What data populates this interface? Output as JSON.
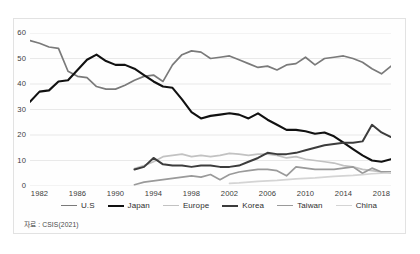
{
  "source_note": "자료 : CSIS(2021)",
  "chart_data": {
    "type": "line",
    "title": "",
    "xlabel": "",
    "ylabel": "",
    "grid": true,
    "legend_position": "bottom",
    "xlim": [
      1981,
      2019
    ],
    "ylim": [
      0,
      60
    ],
    "yticks": [
      0,
      10,
      20,
      30,
      40,
      50,
      60
    ],
    "xticks": [
      1982,
      1986,
      1990,
      1994,
      1998,
      2002,
      2006,
      2010,
      2014,
      2018
    ],
    "colors": {
      "U.S": "#7a7a7a",
      "Japan": "#111111",
      "Europe": "#c2c2c2",
      "Korea": "#3c3c3c",
      "Taiwan": "#9a9a9a",
      "China": "#d4d4d4"
    },
    "series": [
      {
        "name": "U.S",
        "color": "#7a7a7a",
        "width": 1.7,
        "x": [
          1981,
          1982,
          1983,
          1984,
          1985,
          1986,
          1987,
          1988,
          1989,
          1990,
          1991,
          1992,
          1993,
          1994,
          1995,
          1996,
          1997,
          1998,
          1999,
          2000,
          2001,
          2002,
          2003,
          2004,
          2005,
          2006,
          2007,
          2008,
          2009,
          2010,
          2011,
          2012,
          2013,
          2014,
          2015,
          2016,
          2017,
          2018,
          2019
        ],
        "values": [
          57.0,
          56.0,
          54.5,
          54.0,
          45.0,
          43.0,
          42.5,
          39.0,
          38.0,
          38.0,
          39.5,
          41.5,
          43.0,
          43.5,
          41.0,
          47.5,
          51.5,
          53.0,
          52.5,
          50.0,
          50.5,
          51.0,
          49.5,
          48.0,
          46.5,
          47.0,
          45.5,
          47.5,
          48.0,
          50.5,
          47.5,
          50.0,
          50.5,
          51.0,
          50.0,
          48.5,
          46.0,
          44.0,
          47.0
        ]
      },
      {
        "name": "Japan",
        "color": "#111111",
        "width": 2.1,
        "x": [
          1981,
          1982,
          1983,
          1984,
          1985,
          1986,
          1987,
          1988,
          1989,
          1990,
          1991,
          1992,
          1993,
          1994,
          1995,
          1996,
          1997,
          1998,
          1999,
          2000,
          2001,
          2002,
          2003,
          2004,
          2005,
          2006,
          2007,
          2008,
          2009,
          2010,
          2011,
          2012,
          2013,
          2014,
          2015,
          2016,
          2017,
          2018,
          2019
        ],
        "values": [
          33.0,
          37.0,
          37.5,
          41.0,
          41.5,
          45.5,
          49.5,
          51.5,
          49.0,
          47.5,
          47.5,
          46.0,
          43.5,
          41.0,
          39.0,
          38.5,
          34.0,
          29.0,
          26.5,
          27.5,
          28.0,
          28.5,
          28.0,
          26.5,
          28.5,
          26.0,
          24.0,
          22.0,
          22.0,
          21.5,
          20.5,
          21.0,
          19.5,
          17.0,
          14.5,
          12.0,
          10.0,
          9.5,
          10.5
        ]
      },
      {
        "name": "Europe",
        "color": "#c2c2c2",
        "width": 1.7,
        "x": [
          1992,
          1993,
          1994,
          1995,
          1996,
          1997,
          1998,
          1999,
          2000,
          2001,
          2002,
          2003,
          2004,
          2005,
          2006,
          2007,
          2008,
          2009,
          2010,
          2011,
          2012,
          2013,
          2014,
          2015,
          2016,
          2017,
          2018,
          2019
        ],
        "values": [
          6.8,
          8.0,
          9.5,
          11.5,
          12.0,
          12.5,
          11.5,
          12.0,
          11.5,
          12.0,
          12.8,
          12.5,
          12.0,
          12.5,
          12.5,
          12.0,
          11.0,
          11.5,
          10.5,
          10.0,
          9.5,
          9.0,
          8.0,
          7.5,
          6.5,
          6.0,
          5.5,
          5.0
        ]
      },
      {
        "name": "Korea",
        "color": "#3c3c3c",
        "width": 2.0,
        "x": [
          1992,
          1993,
          1994,
          1995,
          1996,
          1997,
          1998,
          1999,
          2000,
          2001,
          2002,
          2003,
          2004,
          2005,
          2006,
          2007,
          2008,
          2009,
          2010,
          2011,
          2012,
          2013,
          2014,
          2015,
          2016,
          2017,
          2018,
          2019
        ],
        "values": [
          6.5,
          7.5,
          11.0,
          8.5,
          8.0,
          8.0,
          7.5,
          8.0,
          8.0,
          7.5,
          7.5,
          8.0,
          9.5,
          11.0,
          13.0,
          12.5,
          12.5,
          13.0,
          14.0,
          15.0,
          16.0,
          16.5,
          17.0,
          17.0,
          17.5,
          24.0,
          21.0,
          19.2
        ]
      },
      {
        "name": "Taiwan",
        "color": "#9a9a9a",
        "width": 1.7,
        "x": [
          1992,
          1993,
          1994,
          1995,
          1996,
          1997,
          1998,
          1999,
          2000,
          2001,
          2002,
          2003,
          2004,
          2005,
          2006,
          2007,
          2008,
          2009,
          2010,
          2011,
          2012,
          2013,
          2014,
          2015,
          2016,
          2017,
          2018,
          2019
        ],
        "values": [
          0.5,
          1.5,
          2.0,
          2.5,
          3.0,
          3.5,
          4.0,
          3.5,
          4.5,
          2.5,
          4.5,
          5.5,
          6.0,
          6.5,
          6.5,
          6.0,
          4.0,
          7.5,
          7.0,
          6.5,
          6.5,
          6.5,
          7.0,
          7.5,
          5.0,
          7.0,
          5.5,
          5.5
        ]
      },
      {
        "name": "China",
        "color": "#d4d4d4",
        "width": 1.7,
        "x": [
          2002,
          2003,
          2004,
          2005,
          2006,
          2007,
          2008,
          2009,
          2010,
          2011,
          2012,
          2013,
          2014,
          2015,
          2016,
          2017,
          2018,
          2019
        ],
        "values": [
          1.0,
          1.2,
          1.5,
          1.8,
          2.0,
          2.2,
          2.5,
          2.8,
          3.0,
          3.2,
          3.5,
          3.8,
          4.0,
          4.2,
          4.5,
          4.8,
          5.0,
          5.2
        ]
      }
    ],
    "legend": [
      {
        "label": "U.S",
        "color": "#7a7a7a",
        "width": 1.7
      },
      {
        "label": "Japan",
        "color": "#111111",
        "width": 2.4
      },
      {
        "label": "Europe",
        "color": "#c2c2c2",
        "width": 1.7
      },
      {
        "label": "Korea",
        "color": "#3c3c3c",
        "width": 2.2
      },
      {
        "label": "Taiwan",
        "color": "#9a9a9a",
        "width": 1.7
      },
      {
        "label": "China",
        "color": "#d4d4d4",
        "width": 1.7
      }
    ]
  }
}
